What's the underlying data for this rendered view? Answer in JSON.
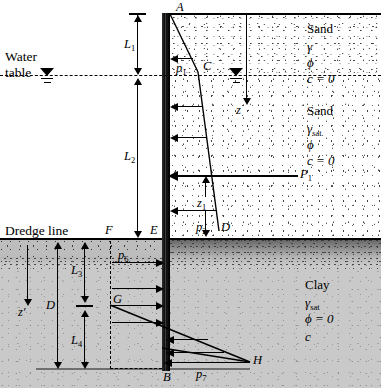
{
  "figure": {
    "type": "engineering-diagram"
  },
  "annotations": {
    "water_table": "Water\ntable",
    "water_table_line1": "Water",
    "water_table_line2": "table",
    "dredge_line": "Dredge line"
  },
  "points": {
    "A": "A",
    "B": "B",
    "C": "C",
    "D": "D",
    "E": "E",
    "F": "F",
    "G": "G",
    "H": "H"
  },
  "dimensions": {
    "L1": "L",
    "L1_sub": "1",
    "L2": "L",
    "L2_sub": "2",
    "L3": "L",
    "L3_sub": "3",
    "L4": "L",
    "L4_sub": "4",
    "D": "D",
    "z": "z",
    "z_prime": "z′",
    "z1": "z",
    "z1_sub": "1"
  },
  "pressures": {
    "p1": "p",
    "p1_sub": "1",
    "p2": "p",
    "p2_sub": "2",
    "p6": "p",
    "p6_sub": "6",
    "p7": "p",
    "p7_sub": "7",
    "P1": "P",
    "P1_sub": "1"
  },
  "soil_layers": [
    {
      "id": "sand-dry",
      "name": "Sand",
      "unit_weight": "γ",
      "friction": "ϕ",
      "cohesion": "c = 0"
    },
    {
      "id": "sand-saturated",
      "name": "Sand",
      "unit_weight": "γ",
      "unit_weight_sub": "sat",
      "friction": "ϕ",
      "cohesion": "c = 0"
    },
    {
      "id": "clay",
      "name": "Clay",
      "unit_weight": "γ",
      "unit_weight_sub": "sat",
      "friction": "ϕ = 0",
      "cohesion": "c"
    }
  ],
  "colors": {
    "clay_fill": "#c9c9c9",
    "sand_fill": "#ffffff",
    "wall": "#111111",
    "line": "#000000",
    "clay_band": "#5c5c5c"
  }
}
